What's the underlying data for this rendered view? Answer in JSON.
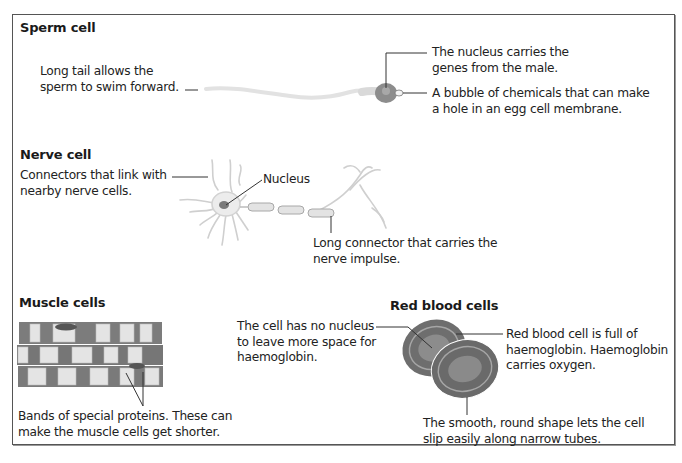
{
  "diagram": {
    "sections": {
      "sperm": {
        "title": "Sperm cell",
        "labels": {
          "tail": [
            "Long tail allows the",
            "sperm to swim forward."
          ],
          "nucleus": [
            "The nucleus carries the",
            "genes from the male."
          ],
          "acrosome": [
            "A bubble of chemicals that can make",
            "a hole in an egg cell membrane."
          ]
        }
      },
      "nerve": {
        "title": "Nerve cell",
        "labels": {
          "connectors": [
            "Connectors that link with",
            "nearby nerve cells."
          ],
          "nucleus": [
            "Nucleus"
          ],
          "axon": [
            "Long connector that carries the",
            "nerve impulse."
          ]
        }
      },
      "muscle": {
        "title": "Muscle cells",
        "labels": {
          "bands": [
            "Bands of special proteins. These can",
            "make the muscle cells get shorter."
          ]
        }
      },
      "rbc": {
        "title": "Red blood cells",
        "labels": {
          "no_nucleus": [
            "The cell has no nucleus",
            "to leave more space for",
            "haemoglobin."
          ],
          "haemoglobin": [
            "Red blood cell is full of",
            "haemoglobin. Haemoglobin",
            "carries oxygen."
          ],
          "shape": [
            "The smooth, round shape lets the cell",
            "slip easily along narrow tubes."
          ]
        }
      }
    },
    "colors": {
      "border": "#555555",
      "text": "#222222",
      "cell_dark": "#6e6e6e",
      "cell_mid": "#8a8a8a",
      "cell_light": "#d8d8d8"
    }
  }
}
